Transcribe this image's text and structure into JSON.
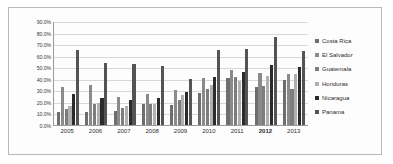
{
  "chart_data": {
    "type": "bar",
    "title": "",
    "xlabel": "",
    "ylabel": "",
    "ylim": [
      0,
      90
    ],
    "grid": true,
    "legend_position": "right",
    "ytick_labels": [
      "90.0%",
      "80.0%",
      "70.0%",
      "60.0%",
      "50.0%",
      "40.0%",
      "30.0%",
      "20.0%",
      "10.0%",
      "0.0%"
    ],
    "ytick_values": [
      90,
      80,
      70,
      60,
      50,
      40,
      30,
      20,
      10,
      0
    ],
    "categories": [
      "2005",
      "2006",
      "2007",
      "2008",
      "2009",
      "2010",
      "2011",
      "2012",
      "2013"
    ],
    "highlighted_category": "2012",
    "series": [
      {
        "name": "Costa Rica",
        "color": "#6e6e6e",
        "values": [
          11.2,
          11.5,
          12.3,
          18.6,
          17.2,
          27.8,
          41.0,
          32.5,
          38.6
        ]
      },
      {
        "name": "El Salvador",
        "color": "#8a8a8a",
        "values": [
          33.2,
          34.4,
          24.4,
          27.0,
          30.0,
          40.8,
          48.0,
          44.6,
          44.2
        ]
      },
      {
        "name": "Guatemala",
        "color": "#7d7d7d",
        "values": [
          14.0,
          18.4,
          14.5,
          17.8,
          21.3,
          31.0,
          41.2,
          33.5,
          31.4
        ]
      },
      {
        "name": "Honduras",
        "color": "#b0b0b0",
        "values": [
          16.2,
          19.0,
          16.8,
          18.0,
          25.8,
          34.2,
          38.2,
          42.6,
          44.4
        ]
      },
      {
        "name": "Nicaragua",
        "color": "#2b2b2b",
        "values": [
          27.2,
          23.4,
          21.6,
          23.2,
          28.4,
          41.6,
          45.8,
          51.6,
          50.6
        ]
      },
      {
        "name": "Panama",
        "color": "#545454",
        "values": [
          65.0,
          53.8,
          52.6,
          51.0,
          40.2,
          65.2,
          66.2,
          76.6,
          64.4
        ]
      }
    ]
  }
}
